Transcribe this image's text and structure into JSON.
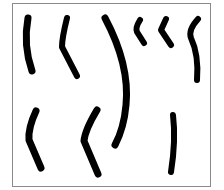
{
  "image": {
    "description": "Nine black brush strokes of varying length and curvature inside a gray-bordered square",
    "colors": {
      "background": "#ffffff",
      "border": "#8a8a8a",
      "stroke": "#000000"
    },
    "strokes": [
      {
        "id": 1,
        "path": "M28 18 Q23 45 32 71",
        "width": 7
      },
      {
        "id": 2,
        "path": "M67 18 Q62 38 62 47 L77 76",
        "width": 6
      },
      {
        "id": 3,
        "path": "M105 18 Q130 65 126 105 Q124 128 115 145",
        "width": 7
      },
      {
        "id": 4,
        "path": "M140 20 Q135 28 137 32 L144 43",
        "width": 6
      },
      {
        "id": 5,
        "path": "M166 19 L161 30 L171 45",
        "width": 6
      },
      {
        "id": 6,
        "path": "M198 19 Q188 30 191 38 Q199 55 197 80",
        "width": 6
      },
      {
        "id": 7,
        "path": "M36 111 Q28 128 29 140 L41 168",
        "width": 7
      },
      {
        "id": 8,
        "path": "M97 110 Q85 130 84 141 L98 174",
        "width": 7
      },
      {
        "id": 9,
        "path": "M173 115 Q176 140 171 172",
        "width": 6
      }
    ]
  }
}
